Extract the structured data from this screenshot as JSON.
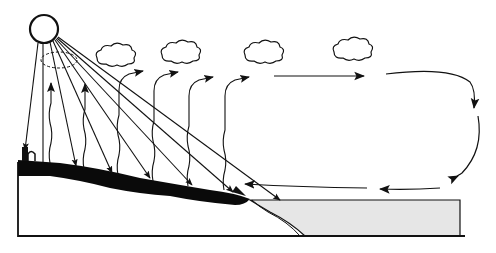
{
  "diagram": {
    "title": "",
    "labels": [],
    "colors": {
      "ink": "#111111",
      "land_surface": "#0a0a0a",
      "sea_fill": "#e6e6e6",
      "background": "#ffffff"
    },
    "elements": {
      "sun": "sun-icon",
      "clouds": [
        "cloud-1",
        "cloud-2",
        "cloud-3",
        "cloud-4",
        "cloud-5"
      ],
      "sun_rays_count": 8,
      "evaporation_arrows_count": 6,
      "upper_wind_arrows_count": 2,
      "lower_wind_arrows_count": 2,
      "downward_circulation_arrow": "right-side descending arrow"
    }
  }
}
